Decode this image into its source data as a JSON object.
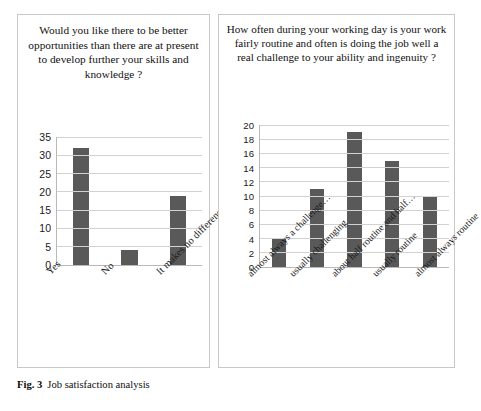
{
  "caption": {
    "figure_number": "Fig. 3",
    "text": "Job satisfaction analysis"
  },
  "chart_data": [
    {
      "type": "bar",
      "panel": "left",
      "title": "Would you like there to be better opportunities than there are at present to develop further your skills and knowledge ?",
      "categories": [
        "Yes",
        "No",
        "It makes no difference…"
      ],
      "values": [
        32,
        4,
        19
      ],
      "xlabel": "",
      "ylabel": "",
      "ylim": [
        0,
        35
      ],
      "yticks": [
        0,
        5,
        10,
        15,
        20,
        25,
        30,
        35
      ],
      "grid": true,
      "legend": "none",
      "bar_color": "#595959"
    },
    {
      "type": "bar",
      "panel": "right",
      "title": "How often during your working day is your work fairly routine and often is doing the job well a real challenge to your ability and ingenuity ?",
      "categories": [
        "almost always a challenge…",
        "usually challenging",
        "about half routine and half…",
        "usually routine",
        "almost always routine"
      ],
      "values": [
        4,
        11,
        19,
        15,
        10
      ],
      "xlabel": "",
      "ylabel": "",
      "ylim": [
        0,
        20
      ],
      "yticks": [
        0,
        2,
        4,
        6,
        8,
        10,
        12,
        14,
        16,
        18,
        20
      ],
      "grid": true,
      "legend": "none",
      "bar_color": "#595959"
    }
  ]
}
